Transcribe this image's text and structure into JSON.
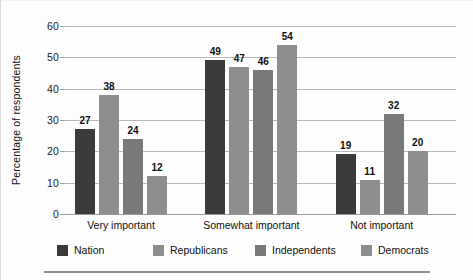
{
  "chart_data": {
    "type": "bar",
    "title": "",
    "subtitle": "",
    "xlabel": "",
    "ylabel": "Percentage of respondents",
    "ylim": [
      0,
      60
    ],
    "ytick_labels": [
      "0",
      "10",
      "20",
      "30",
      "40",
      "50",
      "60"
    ],
    "ytick_values": [
      0,
      10,
      20,
      30,
      40,
      50,
      60
    ],
    "grid": "horizontal",
    "legend_position": "bottom",
    "categories": [
      "Very important",
      "Somewhat important",
      "Not important"
    ],
    "series": [
      {
        "name": "Nation",
        "color": "#3b3b3b",
        "values": [
          27,
          49,
          19
        ],
        "labels": [
          "27",
          "49",
          "19"
        ]
      },
      {
        "name": "Republicans",
        "color": "#8e8e8e",
        "values": [
          38,
          47,
          11
        ],
        "labels": [
          "38",
          "47",
          "11"
        ]
      },
      {
        "name": "Independents",
        "color": "#797979",
        "values": [
          24,
          46,
          32
        ],
        "labels": [
          "24",
          "46",
          "32"
        ]
      },
      {
        "name": "Democrats",
        "color": "#8e8e8e",
        "values": [
          12,
          54,
          20
        ],
        "labels": [
          "12",
          "54",
          "20"
        ]
      }
    ]
  },
  "axis": {
    "y": {
      "label": "Percentage of respondents",
      "ticks": [
        "60",
        "50",
        "40",
        "30",
        "20",
        "10",
        "0"
      ]
    },
    "x": {
      "categories": [
        "Very important",
        "Somewhat important",
        "Not important"
      ]
    }
  },
  "legend": {
    "items": [
      {
        "label": "Nation",
        "color": "#3b3b3b"
      },
      {
        "label": "Republicans",
        "color": "#8e8e8e"
      },
      {
        "label": "Independents",
        "color": "#797979"
      },
      {
        "label": "Democrats",
        "color": "#8e8e8e"
      }
    ]
  }
}
